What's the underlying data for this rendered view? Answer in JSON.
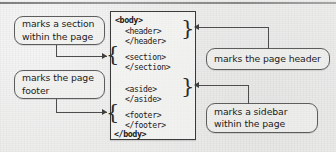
{
  "figure": {
    "background_color": "#ededec",
    "line_color": "#4d4d4d",
    "text_color": "#1b1b1b"
  },
  "code_box": {
    "lines": [
      {
        "id": "body-open",
        "text": "<body>",
        "bold": true,
        "indent": 0
      },
      {
        "id": "header-open",
        "text": "<header>",
        "bold": false,
        "indent": 1
      },
      {
        "id": "header-close",
        "text": "</header>",
        "bold": false,
        "indent": 1
      },
      {
        "id": "section-open",
        "text": "<section>",
        "bold": false,
        "indent": 1
      },
      {
        "id": "section-close",
        "text": "</section>",
        "bold": false,
        "indent": 1
      },
      {
        "id": "aside-open",
        "text": "<aside>",
        "bold": false,
        "indent": 1
      },
      {
        "id": "aside-close",
        "text": "</aside>",
        "bold": false,
        "indent": 1
      },
      {
        "id": "footer-open",
        "text": "<footer>",
        "bold": false,
        "indent": 1
      },
      {
        "id": "footer-close",
        "text": "</footer>",
        "bold": false,
        "indent": 1
      },
      {
        "id": "body-close",
        "text": "</body>",
        "bold": true,
        "indent": 0
      }
    ],
    "blocks": {
      "body_open": "<body>",
      "header": "<header>\n</header>",
      "section": "<section>\n</section>",
      "aside": "<aside>\n</aside>",
      "footer": "<footer>\n</footer>",
      "body_close": "</body>"
    },
    "braces": {
      "header": "}",
      "section": "{",
      "aside": "}",
      "footer": "{"
    }
  },
  "callouts": {
    "section": {
      "label": "marks a section\nwithin the page",
      "side": "left",
      "targets": "section"
    },
    "footer": {
      "label": "marks the page\nfooter",
      "side": "left",
      "targets": "footer"
    },
    "header": {
      "label": "marks the page header",
      "side": "right",
      "targets": "header"
    },
    "sidebar": {
      "label": "marks a sidebar\nwithin the page",
      "side": "right",
      "targets": "aside"
    }
  }
}
